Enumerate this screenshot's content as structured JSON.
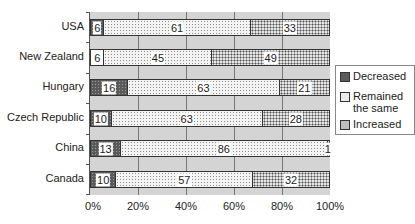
{
  "chart_data": {
    "type": "bar",
    "orientation": "horizontal",
    "stacked": "percent",
    "title": "",
    "xlabel": "",
    "ylabel": "",
    "categories": [
      "USA",
      "New Zealand",
      "Hungary",
      "Czech Republic",
      "China",
      "Canada"
    ],
    "series": [
      {
        "name": "Decreased",
        "values": [
          6,
          6,
          16,
          10,
          13,
          10
        ]
      },
      {
        "name": "Remained the same",
        "values": [
          61,
          45,
          63,
          63,
          86,
          57
        ]
      },
      {
        "name": "Increased",
        "values": [
          33,
          49,
          21,
          28,
          1,
          32
        ]
      }
    ],
    "xlim": [
      0,
      100
    ],
    "xticks": [
      "0%",
      "20%",
      "40%",
      "60%",
      "80%",
      "100%"
    ],
    "grid": true,
    "legend_position": "right",
    "colors": {
      "plot_bg": "#d4d4d4",
      "decreased": "#5a5a5a",
      "remained": "#f4f4f4",
      "increased": "#e6e6e6"
    }
  },
  "legend": {
    "decreased": "Decreased",
    "remained_1": "Remained",
    "remained_2": "the same",
    "increased": "Increased"
  },
  "rows": [
    {
      "label": "USA",
      "dec": "6",
      "same": "61",
      "inc": "33",
      "w": [
        6,
        61,
        33
      ]
    },
    {
      "label": "New Zealand",
      "dec": "6",
      "same": "45",
      "inc": "49",
      "w": [
        6,
        45,
        49
      ]
    },
    {
      "label": "Hungary",
      "dec": "16",
      "same": "63",
      "inc": "21",
      "w": [
        16,
        63,
        21
      ]
    },
    {
      "label": "Czech Republic",
      "dec": "10",
      "same": "63",
      "inc": "28",
      "w": [
        9,
        63,
        28
      ]
    },
    {
      "label": "China",
      "dec": "13",
      "same": "86",
      "inc": "1",
      "w": [
        13,
        86,
        1
      ]
    },
    {
      "label": "Canada",
      "dec": "10",
      "same": "57",
      "inc": "32",
      "w": [
        11,
        57,
        32
      ]
    }
  ],
  "xticks": [
    "0%",
    "20%",
    "40%",
    "60%",
    "80%",
    "100%"
  ]
}
